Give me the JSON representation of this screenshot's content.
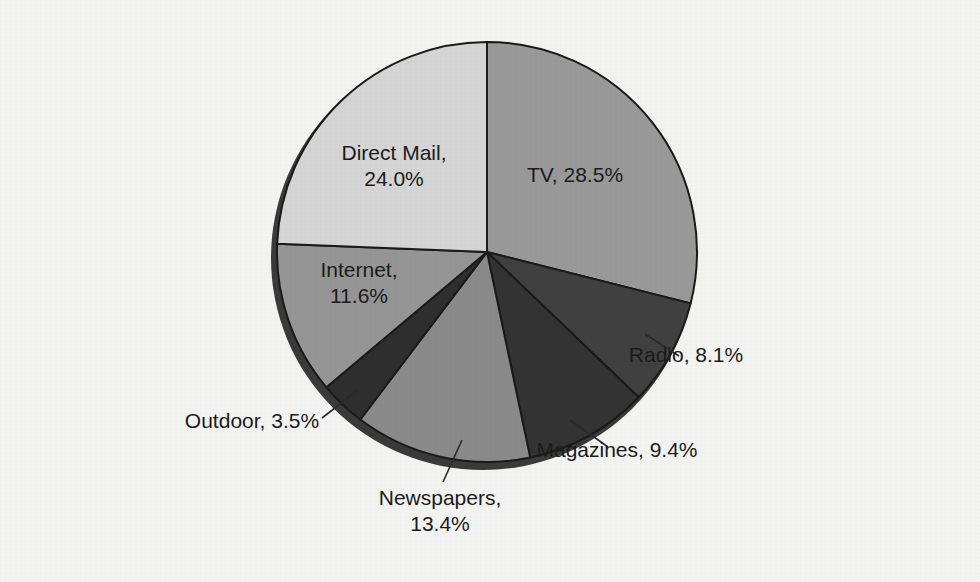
{
  "figure": {
    "background_color": "#f3f3f1",
    "text_color": "#1b1b1b",
    "outline_color": "#1a1a1a",
    "shadow_color": "#3a3a3a"
  },
  "chart_data": {
    "type": "pie",
    "title": "",
    "subtitle": "",
    "xlabel": "",
    "ylabel": "",
    "grid": false,
    "legend_position": "none",
    "label_format": "{name}, {value}%",
    "start_angle_deg": 0,
    "direction": "clockwise",
    "total": 98.5,
    "categories": [
      "TV",
      "Radio",
      "Magazines",
      "Newspapers",
      "Outdoor",
      "Internet",
      "Direct Mail"
    ],
    "values": [
      28.5,
      8.1,
      9.4,
      13.4,
      3.5,
      11.6,
      24.0
    ],
    "colors": [
      "#999999",
      "#404040",
      "#333333",
      "#8a8a8a",
      "#2e2e2e",
      "#959595",
      "#d5d5d5"
    ],
    "slices": [
      {
        "name": "TV",
        "value": 28.5,
        "label": "TV, 28.5%",
        "label_line1": "TV, 28.5%",
        "label_line2": "",
        "color": "#999999",
        "label_placement": "inside",
        "label_x": 575,
        "label_y": 182
      },
      {
        "name": "Radio",
        "value": 8.1,
        "label": "Radio, 8.1%",
        "label_line1": "Radio, 8.1%",
        "label_line2": "",
        "color": "#404040",
        "label_placement": "outside",
        "label_x": 686,
        "label_y": 362,
        "leader_x1": 645,
        "leader_y1": 334,
        "leader_x2": 679,
        "leader_y2": 356
      },
      {
        "name": "Magazines",
        "value": 9.4,
        "label": "Magazines, 9.4%",
        "label_line1": "Magazines, 9.4%",
        "label_line2": "",
        "color": "#333333",
        "label_placement": "outside",
        "label_x": 617,
        "label_y": 457,
        "leader_x1": 570,
        "leader_y1": 420,
        "leader_x2": 608,
        "leader_y2": 447
      },
      {
        "name": "Newspapers",
        "value": 13.4,
        "label": "Newspapers, 13.4%",
        "label_line1": "Newspapers,",
        "label_line2": "13.4%",
        "color": "#8a8a8a",
        "label_placement": "outside",
        "label_x": 440,
        "label_y": 505,
        "leader_x1": 462,
        "leader_y1": 440,
        "leader_x2": 443,
        "leader_y2": 482
      },
      {
        "name": "Outdoor",
        "value": 3.5,
        "label": "Outdoor, 3.5%",
        "label_line1": "Outdoor, 3.5%",
        "label_line2": "",
        "color": "#2e2e2e",
        "label_placement": "outside",
        "label_x": 252,
        "label_y": 428,
        "leader_x1": 358,
        "leader_y1": 390,
        "leader_x2": 322,
        "leader_y2": 418
      },
      {
        "name": "Internet",
        "value": 11.6,
        "label": "Internet, 11.6%",
        "label_line1": "Internet,",
        "label_line2": "11.6%",
        "color": "#959595",
        "label_placement": "inside",
        "label_x": 359,
        "label_y": 277
      },
      {
        "name": "Direct Mail",
        "value": 24.0,
        "label": "Direct Mail, 24.0%",
        "label_line1": "Direct Mail,",
        "label_line2": "24.0%",
        "color": "#d5d5d5",
        "label_placement": "inside",
        "label_x": 394,
        "label_y": 160
      }
    ],
    "geometry": {
      "center_x": 487,
      "center_y": 252,
      "radius": 210,
      "shadow_offset_x": -4,
      "shadow_offset_y": 6
    }
  }
}
